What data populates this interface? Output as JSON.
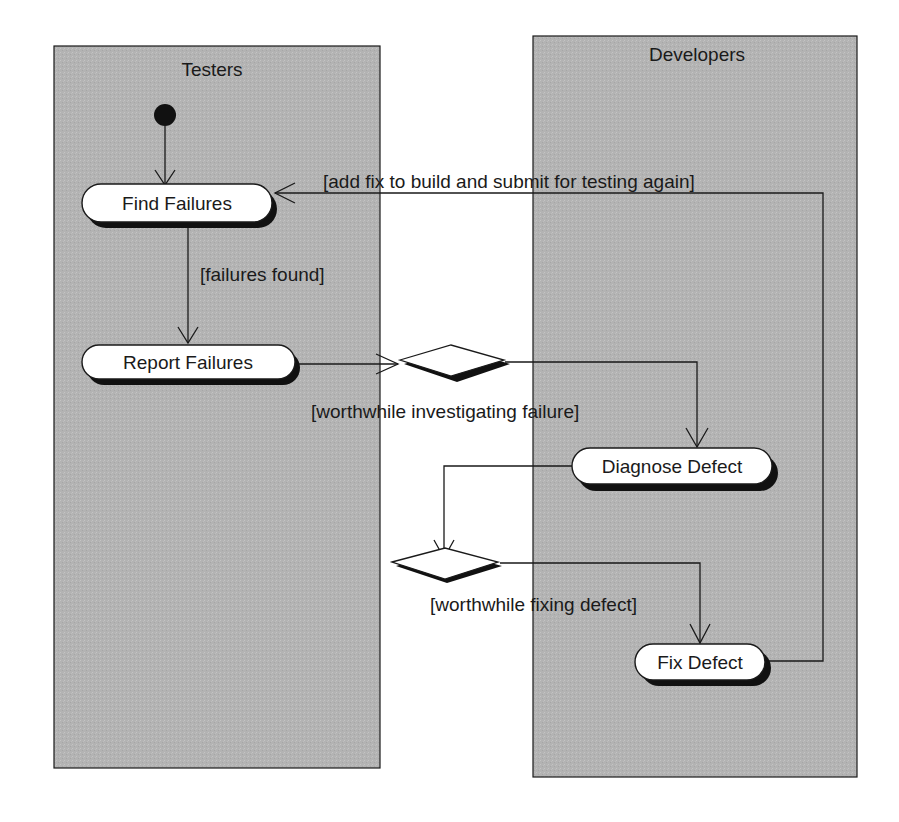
{
  "diagram": {
    "type": "UML activity diagram with swimlanes",
    "lanes": [
      {
        "id": "testers",
        "title": "Testers"
      },
      {
        "id": "developers",
        "title": "Developers"
      }
    ],
    "activities": [
      {
        "id": "find_failures",
        "label": "Find Failures",
        "lane": "testers"
      },
      {
        "id": "report_failures",
        "label": "Report Failures",
        "lane": "testers"
      },
      {
        "id": "diagnose_defect",
        "label": "Diagnose Defect",
        "lane": "developers"
      },
      {
        "id": "fix_defect",
        "label": "Fix Defect",
        "lane": "developers"
      }
    ],
    "decisions": [
      {
        "id": "decision_investigate"
      },
      {
        "id": "decision_fix"
      }
    ],
    "guards": {
      "add_fix": "[add fix to build and submit for testing again]",
      "failures_found": "[failures found]",
      "worthwhile_investigating": "[worthwhile investigating failure]",
      "worthwhile_fixing": "[worthwhile fixing defect]"
    },
    "flows": [
      {
        "from": "initial",
        "to": "find_failures"
      },
      {
        "from": "find_failures",
        "to": "report_failures",
        "guard": "[failures found]"
      },
      {
        "from": "report_failures",
        "to": "decision_investigate"
      },
      {
        "from": "decision_investigate",
        "to": "diagnose_defect",
        "guard": "[worthwhile investigating failure]"
      },
      {
        "from": "diagnose_defect",
        "to": "decision_fix"
      },
      {
        "from": "decision_fix",
        "to": "fix_defect",
        "guard": "[worthwhile fixing defect]"
      },
      {
        "from": "fix_defect",
        "to": "find_failures",
        "guard": "[add fix to build and submit for testing again]"
      }
    ],
    "colors": {
      "lane_fill": "#b5b5b5",
      "stroke": "#1a1a1a",
      "activity_fill": "#ffffff",
      "background": "#ffffff"
    }
  }
}
